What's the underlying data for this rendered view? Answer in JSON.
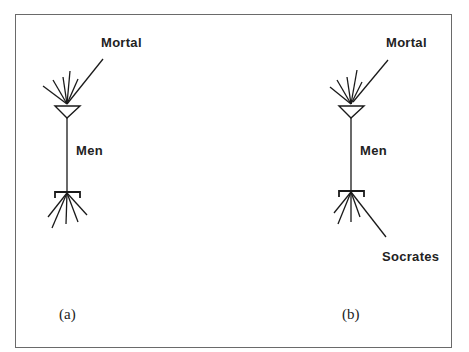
{
  "figure": {
    "panels": [
      {
        "id": "a",
        "caption": "(a)",
        "labels": {
          "top": "Mortal",
          "middle": "Men"
        }
      },
      {
        "id": "b",
        "caption": "(b)",
        "labels": {
          "top": "Mortal",
          "middle": "Men",
          "bottom": "Socrates"
        }
      }
    ]
  },
  "colors": {
    "stroke": "#1a1a1a",
    "frame": "#6a6a6a",
    "background": "#ffffff"
  }
}
